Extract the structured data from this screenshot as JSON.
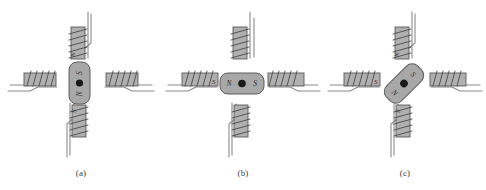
{
  "figure": {
    "panel_count": 3,
    "colors": {
      "core_fill": "#b0b0b0",
      "core_stroke": "#5a5a5a",
      "magnet_fill": "#a8a8a8",
      "magnet_stroke": "#5c5c5c",
      "winding_stroke": "#4a4a4a",
      "lead_stroke": "#8a8a8a",
      "rotor_dot": "#1a1a1a",
      "text": "#2e2e2e",
      "background": "#ffffff"
    }
  },
  "panels": [
    {
      "id": "a",
      "caption": "(a)",
      "magnet": {
        "orientation": "vertical",
        "rotation_deg": 0,
        "top_pole": "S",
        "bottom_pole": "N",
        "left_pole": "",
        "right_pole": "",
        "center_marker": "shaft-dot"
      },
      "coils": [
        {
          "position": "top",
          "pole_label": "N",
          "winding_turns": 5,
          "lead_side": "right"
        },
        {
          "position": "right",
          "pole_label": "",
          "winding_turns": 5,
          "lead_side": "bottom"
        },
        {
          "position": "bottom",
          "pole_label": "S",
          "winding_turns": 5,
          "lead_side": "left"
        },
        {
          "position": "left",
          "pole_label": "",
          "winding_turns": 5,
          "lead_side": "bottom"
        }
      ]
    },
    {
      "id": "b",
      "caption": "(b)",
      "magnet": {
        "orientation": "horizontal",
        "rotation_deg": 90,
        "top_pole": "",
        "bottom_pole": "",
        "left_pole": "N",
        "right_pole": "S",
        "center_marker": "shaft-dot"
      },
      "coils": [
        {
          "position": "top",
          "pole_label": "",
          "winding_turns": 5,
          "lead_side": "right"
        },
        {
          "position": "right",
          "pole_label": "",
          "winding_turns": 5,
          "lead_side": "bottom"
        },
        {
          "position": "bottom",
          "pole_label": "",
          "winding_turns": 5,
          "lead_side": "left"
        },
        {
          "position": "left",
          "pole_label": "S",
          "winding_turns": 5,
          "lead_side": "bottom"
        }
      ]
    },
    {
      "id": "c",
      "caption": "(c)",
      "magnet": {
        "orientation": "diagonal",
        "rotation_deg": -45,
        "top_pole": "",
        "bottom_pole": "",
        "left_pole": "N",
        "right_pole": "S",
        "center_marker": "shaft-dot"
      },
      "coils": [
        {
          "position": "top",
          "pole_label": "N",
          "winding_turns": 5,
          "lead_side": "right"
        },
        {
          "position": "right",
          "pole_label": "",
          "winding_turns": 5,
          "lead_side": "bottom"
        },
        {
          "position": "bottom",
          "pole_label": "S",
          "winding_turns": 5,
          "lead_side": "left"
        },
        {
          "position": "left",
          "pole_label": "S",
          "winding_turns": 5,
          "lead_side": "bottom"
        }
      ]
    }
  ]
}
